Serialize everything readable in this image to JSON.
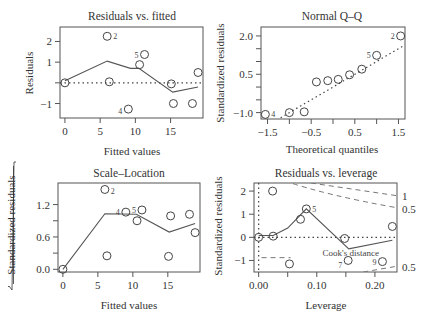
{
  "chart_data": [
    {
      "type": "scatter",
      "title": "Residuals vs. fitted",
      "xlabel": "Fitted values",
      "ylabel": "Residuals",
      "xlim": [
        -0.7,
        19.6
      ],
      "ylim": [
        -1.7,
        2.7
      ],
      "xticks": [
        0,
        5,
        10,
        15
      ],
      "yticks": [
        -1,
        0,
        1,
        2
      ],
      "ytick_labels": [
        "−1",
        "",
        "1",
        "2"
      ],
      "points": [
        {
          "x": 0.0,
          "y": 0.0
        },
        {
          "x": 6.0,
          "y": 2.25,
          "label": "2"
        },
        {
          "x": 6.3,
          "y": 0.05
        },
        {
          "x": 9.0,
          "y": -1.27,
          "label": "4"
        },
        {
          "x": 10.6,
          "y": 0.88
        },
        {
          "x": 11.3,
          "y": 1.37,
          "label": "5"
        },
        {
          "x": 15.1,
          "y": -0.05
        },
        {
          "x": 15.4,
          "y": -1.0
        },
        {
          "x": 18.1,
          "y": -1.0
        },
        {
          "x": 18.9,
          "y": 0.5
        }
      ],
      "smoother": [
        [
          0,
          0.1
        ],
        [
          6.0,
          1.05
        ],
        [
          9.3,
          0.7
        ],
        [
          10.5,
          0.7
        ],
        [
          15.3,
          -0.45
        ],
        [
          18.9,
          -0.2
        ]
      ],
      "reference_line": {
        "y": 0,
        "style": "dotted"
      }
    },
    {
      "type": "scatter",
      "title": "Normal Q–Q",
      "xlabel": "Theoretical quantiles",
      "ylabel": "Standardized residuals",
      "xlim": [
        -1.65,
        1.65
      ],
      "ylim": [
        -1.25,
        2.35
      ],
      "xticks": [
        -1.5,
        -1.0,
        -0.5,
        0.0,
        0.5,
        1.0,
        1.5
      ],
      "xtick_labels": [
        "−1.5",
        "",
        "−0.5",
        "",
        "0.5",
        "",
        "1.5"
      ],
      "yticks": [
        -1.0,
        -0.5,
        0.0,
        0.5,
        1.0,
        1.5,
        2.0
      ],
      "ytick_labels": [
        "−1.0",
        "",
        "",
        "0.5",
        "",
        "",
        "2.0"
      ],
      "points": [
        {
          "x": -1.55,
          "y": -1.07,
          "label": "4"
        },
        {
          "x": -1.0,
          "y": -1.0
        },
        {
          "x": -0.66,
          "y": -0.97
        },
        {
          "x": -0.38,
          "y": 0.2
        },
        {
          "x": -0.12,
          "y": 0.25
        },
        {
          "x": 0.12,
          "y": 0.3
        },
        {
          "x": 0.38,
          "y": 0.48
        },
        {
          "x": 0.66,
          "y": 0.7
        },
        {
          "x": 1.0,
          "y": 1.24,
          "label": "5"
        },
        {
          "x": 1.55,
          "y": 2.0,
          "label": "2"
        }
      ],
      "reference_line": {
        "from": [
          -1.2,
          -1.2
        ],
        "to": [
          1.65,
          1.65
        ],
        "style": "dotted"
      }
    },
    {
      "type": "scatter",
      "title": "Scale–Location",
      "xlabel": "Fitted values",
      "ylabel": "√|Standardized residuals|",
      "xlim": [
        -0.7,
        19.6
      ],
      "ylim": [
        -0.05,
        1.6
      ],
      "xticks": [
        0,
        5,
        10,
        15
      ],
      "yticks": [
        0.0,
        0.3,
        0.6,
        0.9,
        1.2
      ],
      "ytick_labels": [
        "0.0",
        "",
        "0.6",
        "",
        "1.2"
      ],
      "points": [
        {
          "x": 0.0,
          "y": 0.0
        },
        {
          "x": 6.0,
          "y": 1.48,
          "label": "2"
        },
        {
          "x": 6.3,
          "y": 0.25
        },
        {
          "x": 9.0,
          "y": 1.06,
          "label": "4"
        },
        {
          "x": 10.6,
          "y": 0.9
        },
        {
          "x": 11.3,
          "y": 1.1,
          "label": "5"
        },
        {
          "x": 15.1,
          "y": 0.24
        },
        {
          "x": 15.4,
          "y": 0.99
        },
        {
          "x": 18.1,
          "y": 1.02
        },
        {
          "x": 18.9,
          "y": 0.68
        }
      ],
      "smoother": [
        [
          0,
          0.0
        ],
        [
          6.0,
          1.03
        ],
        [
          10.5,
          1.02
        ],
        [
          15.2,
          0.69
        ],
        [
          18.9,
          0.85
        ]
      ]
    },
    {
      "type": "scatter",
      "title": "Residuals vs. leverage",
      "xlabel": "Leverage",
      "ylabel": "Standardized residuals",
      "xlim": [
        -0.008,
        0.238
      ],
      "ylim": [
        -1.5,
        2.35
      ],
      "xticks": [
        0.0,
        0.05,
        0.1,
        0.15,
        0.2
      ],
      "xtick_labels": [
        "0.00",
        "",
        "0.10",
        "",
        "0.20"
      ],
      "yticks": [
        -1,
        0,
        1,
        2
      ],
      "ytick_labels": [
        "−1",
        "0",
        "1",
        "2"
      ],
      "points": [
        {
          "x": 0.0,
          "y": 0.0
        },
        {
          "x": 0.024,
          "y": 2.0
        },
        {
          "x": 0.025,
          "y": 0.05
        },
        {
          "x": 0.053,
          "y": -1.15
        },
        {
          "x": 0.072,
          "y": 0.78
        },
        {
          "x": 0.082,
          "y": 1.23,
          "label": "5"
        },
        {
          "x": 0.148,
          "y": -0.05
        },
        {
          "x": 0.154,
          "y": -1.0,
          "label": "7"
        },
        {
          "x": 0.213,
          "y": -1.05,
          "label": "9"
        },
        {
          "x": 0.23,
          "y": 0.47
        }
      ],
      "smoother": [
        [
          0.0,
          0.08
        ],
        [
          0.025,
          0.08
        ],
        [
          0.05,
          0.4
        ],
        [
          0.082,
          1.23
        ],
        [
          0.155,
          -0.5
        ],
        [
          0.23,
          -0.13
        ]
      ],
      "reference_lines": [
        {
          "y": 0,
          "style": "dotted"
        },
        {
          "x": 0,
          "style": "dotted"
        }
      ],
      "cooks_distance": {
        "legend": "Cook's distance",
        "levels": [
          "1",
          "0.5",
          "0.5"
        ]
      }
    }
  ],
  "panels": {
    "p1": {
      "title": "Residuals vs. fitted",
      "xlabel": "Fitted values",
      "ylabel": "Residuals"
    },
    "p2": {
      "title": "Normal Q–Q",
      "xlabel": "Theoretical quantiles",
      "ylabel": "Standardized residuals"
    },
    "p3": {
      "title": "Scale–Location",
      "xlabel": "Fitted values",
      "ylabel": "Standardized residuals"
    },
    "p4": {
      "title": "Residuals vs. leverage",
      "xlabel": "Leverage",
      "ylabel": "Standardized residuals",
      "cook_label": "Cook's distance",
      "cook_levels": [
        "1",
        "0.5",
        "0.5"
      ]
    }
  }
}
